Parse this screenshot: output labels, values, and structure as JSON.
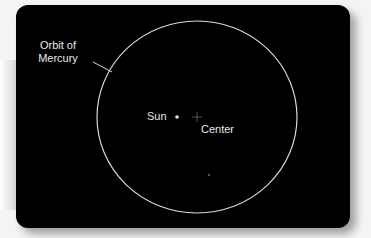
{
  "diagram": {
    "orbit_label_line1": "Orbit of",
    "orbit_label_line2": "Mercury",
    "sun_label": "Sun",
    "center_label": "Center",
    "colors": {
      "background": "#000000",
      "orbit": "#d8d8d8",
      "text": "#e8e8e8"
    }
  }
}
